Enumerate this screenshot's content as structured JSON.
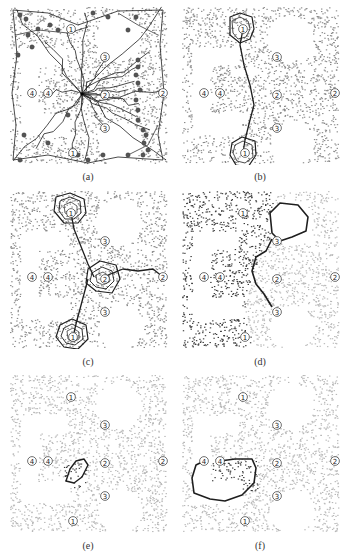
{
  "figure": {
    "panels": [
      {
        "id": "a",
        "label": "(a)",
        "left": 8,
        "top": 5,
        "label_top": 171,
        "style": "dense-paths",
        "markers": [
          "①",
          "③",
          "④",
          "④",
          "②",
          "②",
          "③",
          "①"
        ]
      },
      {
        "id": "b",
        "label": "(b)",
        "left": 180,
        "top": 5,
        "label_top": 171,
        "style": "path-b",
        "markers": [
          "①",
          "③",
          "④",
          "④",
          "②",
          "②",
          "③",
          "①"
        ]
      },
      {
        "id": "c",
        "label": "(c)",
        "left": 8,
        "top": 189,
        "label_top": 356,
        "style": "path-c",
        "markers": [
          "①",
          "③",
          "④",
          "④",
          "②",
          "②",
          "③",
          "①"
        ]
      },
      {
        "id": "d",
        "label": "(d)",
        "left": 180,
        "top": 189,
        "label_top": 356,
        "style": "path-d",
        "markers": [
          "①",
          "③",
          "④",
          "④",
          "②",
          "②",
          "③",
          "①"
        ]
      },
      {
        "id": "e",
        "label": "(e)",
        "left": 8,
        "top": 373,
        "label_top": 540,
        "style": "path-e",
        "markers": [
          "①",
          "③",
          "④",
          "④",
          "②",
          "②",
          "③",
          "①"
        ]
      },
      {
        "id": "f",
        "label": "(f)",
        "left": 180,
        "top": 373,
        "label_top": 540,
        "style": "path-f",
        "markers": [
          "①",
          "③",
          "④",
          "④",
          "②",
          "②",
          "③",
          "①"
        ]
      }
    ],
    "caption": "",
    "colors": {
      "dots": "#8a8a8a",
      "dots_dark": "#3a3a3a",
      "dots_light": "#b8b8b8",
      "path": "#1e1e1e",
      "node": "#555555"
    }
  }
}
